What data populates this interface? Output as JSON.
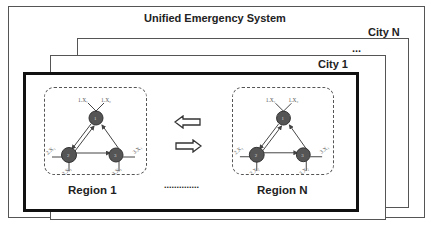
{
  "diagram": {
    "title": "Unified Emergency System",
    "cities": [
      {
        "label": "City N"
      },
      {
        "label": "..."
      },
      {
        "label": "City 1"
      }
    ],
    "regions": [
      {
        "label": "Region 1",
        "nodes": [
          "1",
          "2",
          "3"
        ],
        "node_labels": [
          "1.X₁",
          "1.X₂",
          "2.X₁",
          "2.X₂",
          "3.X₁",
          "3.X₂"
        ]
      },
      {
        "label": "Region N",
        "nodes": [
          "1",
          "2",
          "3"
        ],
        "node_labels": [
          "1.X₁",
          "1.X₂",
          "2.X₁",
          "2.X₂",
          "3.X₁",
          "3.X₂"
        ]
      }
    ],
    "between_regions": "..............",
    "arrows": [
      "left-arrow",
      "right-arrow"
    ],
    "colors": {
      "node_fill": "#555555",
      "border": "#555555",
      "inner_border": "#111111"
    }
  }
}
